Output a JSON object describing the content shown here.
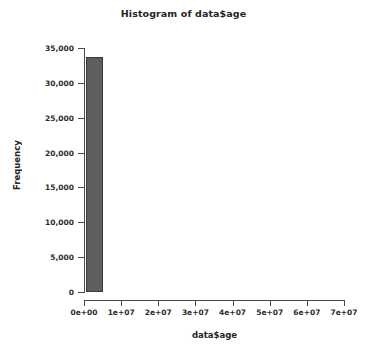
{
  "chart_data": {
    "type": "bar",
    "title": "Histogram of data$age",
    "xlabel": "data$age",
    "ylabel": "Frequency",
    "grid": false,
    "legend": false,
    "xlim": [
      0,
      70000000
    ],
    "ylim": [
      0,
      35000
    ],
    "xticks": [
      {
        "value": 0,
        "label": "0e+00"
      },
      {
        "value": 10000000,
        "label": "1e+07"
      },
      {
        "value": 20000000,
        "label": "2e+07"
      },
      {
        "value": 30000000,
        "label": "3e+07"
      },
      {
        "value": 40000000,
        "label": "4e+07"
      },
      {
        "value": 50000000,
        "label": "5e+07"
      },
      {
        "value": 60000000,
        "label": "6e+07"
      },
      {
        "value": 70000000,
        "label": "7e+07"
      }
    ],
    "yticks": [
      {
        "value": 0,
        "label": "0"
      },
      {
        "value": 5000,
        "label": "5,000"
      },
      {
        "value": 10000,
        "label": "10,000"
      },
      {
        "value": 15000,
        "label": "15,000"
      },
      {
        "value": 20000,
        "label": "20,000"
      },
      {
        "value": 25000,
        "label": "25,000"
      },
      {
        "value": 30000,
        "label": "30,000"
      },
      {
        "value": 35000,
        "label": "35,000"
      }
    ],
    "bins": [
      {
        "x0": 500000,
        "x1": 5000000,
        "value": 33700
      }
    ],
    "bar_fill": "#5e5e5e",
    "bar_border": "#3a3a3a",
    "axis_color": "#4a4a4a",
    "background": "#ffffff"
  }
}
